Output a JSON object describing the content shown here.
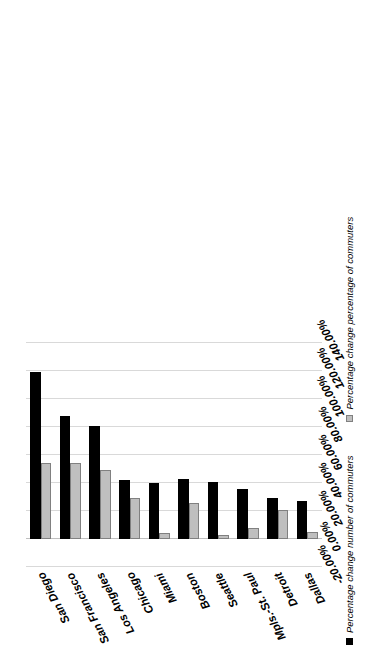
{
  "chart": {
    "type": "bar",
    "orientation": "rotated-90ccw",
    "background_color": "#ffffff"
  },
  "chart_data": {
    "type": "bar",
    "title": "",
    "subtitle": "",
    "xlabel": "",
    "ylabel": "",
    "orientation": "horizontal",
    "grid": true,
    "legend_position": "bottom",
    "categories": [
      "San Diego",
      "San Francisco",
      "Los Angeles",
      "Chicago",
      "Miami",
      "Boston",
      "Seattle",
      "Mpls.-St. Paul",
      "Detroit",
      "Dallas"
    ],
    "series": [
      {
        "name": "Percentage change number of commuters",
        "color": "#000000",
        "values": [
          119.0,
          88.0,
          81.0,
          42.0,
          40.0,
          43.0,
          41.0,
          36.0,
          29.0,
          27.0
        ]
      },
      {
        "name": "Percentage change percentage of commuters",
        "color": "#bfbfbf",
        "values": [
          54.0,
          54.0,
          49.0,
          29.0,
          4.0,
          26.0,
          3.0,
          8.0,
          21.0,
          5.0
        ]
      }
    ],
    "value_axis": {
      "min": -20.0,
      "max": 140.0,
      "tick_step": 20.0,
      "tick_labels": [
        "-20.00%",
        "0.00%",
        "20.00%",
        "40.00%",
        "60.00%",
        "80.00%",
        "100.00%",
        "120.00%",
        "140.00%"
      ],
      "tick_values": [
        -20,
        0,
        20,
        40,
        60,
        80,
        100,
        120,
        140
      ]
    }
  },
  "legend": {
    "items": [
      {
        "label": "Percentage change number of commuters",
        "swatch": "black-square-swatch"
      },
      {
        "label": "Percentage change percentage of commuters",
        "swatch": "gray-square-swatch"
      }
    ]
  }
}
